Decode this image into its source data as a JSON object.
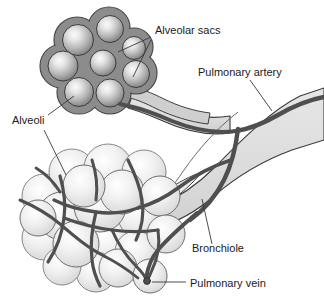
{
  "figure": {
    "background_color": "#ffffff",
    "width": 324,
    "height": 302
  },
  "labels": [
    {
      "id": "alveolar-sacs",
      "text": "Alveolar sacs",
      "x": 155,
      "y": 34
    },
    {
      "id": "pulmonary-artery",
      "text": "Pulmonary artery",
      "x": 198,
      "y": 76
    },
    {
      "id": "alveoli",
      "text": "Alveoli",
      "x": 12,
      "y": 124
    },
    {
      "id": "bronchiole",
      "text": "Bronchiole",
      "x": 192,
      "y": 252
    },
    {
      "id": "pulmonary-vein",
      "text": "Pulmonary vein",
      "x": 190,
      "y": 287
    }
  ],
  "leader_lines": [
    {
      "id": "leader-alveolar-sacs-a",
      "points": "151,37 118,52"
    },
    {
      "id": "leader-alveolar-sacs-b",
      "points": "151,40 133,77"
    },
    {
      "id": "leader-pulmonary-artery",
      "points": "250,80 272,111"
    },
    {
      "id": "leader-alveoli-a",
      "points": "48,115 74,96"
    },
    {
      "id": "leader-alveoli-b",
      "points": "44,130 66,175"
    },
    {
      "id": "leader-bronchiole",
      "points": "212,244 202,199"
    },
    {
      "id": "leader-pulmonary-vein",
      "points": "186,282 152,282"
    }
  ],
  "colors": {
    "outline": "#2b2b2b",
    "sac_blob_fill": "#8a8a8a",
    "sac_blob_stroke": "#4a4a4a",
    "sac_sphere_center": "#f2f2f2",
    "sac_sphere_edge": "#7e7e7e",
    "alveoli_sphere_center": "#f6f6f6",
    "alveoli_sphere_edge": "#d2d2d2",
    "alveoli_stroke": "#6e6e6e",
    "bronchiole_fill": "#dedede",
    "bronchiole_stroke": "#3a3a3a",
    "vessel_dark": "#4f4f4f",
    "label_text": "#1a1a1a",
    "leader_line": "#3a3a3a"
  },
  "structures": {
    "alveolar_sac_cluster": {
      "name": "alveolar-sac-cluster",
      "sphere_count": 7,
      "center_x": 105,
      "center_y": 62
    },
    "alveoli_cluster": {
      "name": "alveoli-cluster",
      "sphere_count": 20,
      "center_x": 90,
      "center_y": 218
    },
    "bronchiole_tube": {
      "name": "bronchiole-tube",
      "description": "light gray branching airway running from lower-left clusters to upper-right edge"
    },
    "vessels": {
      "name": "pulmonary-vessel-network",
      "description": "dark gray branching blood vessels over bronchiole and alveoli"
    }
  }
}
